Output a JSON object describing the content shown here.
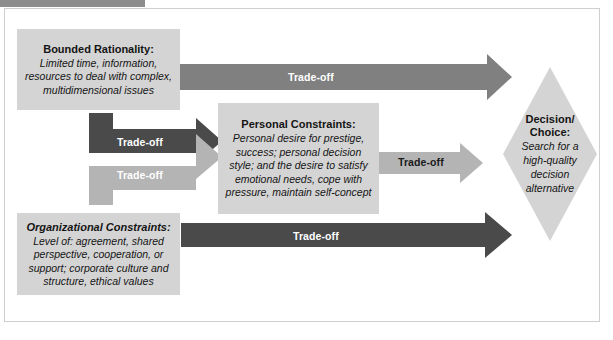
{
  "diagram": {
    "colors": {
      "box_fill": "#d4d4d4",
      "arrow_dark": "#4a4a4a",
      "arrow_medium": "#808080",
      "arrow_light": "#b4b4b4",
      "top_tab": "#8d8d8d",
      "frame_border": "#cfcfcf",
      "text": "#141414"
    },
    "boxes": [
      {
        "id": "bounded-rationality",
        "heading": "Bounded Rationality:",
        "heading_style": "bold",
        "body": "Limited time, information, resources to deal with complex, multidimensional issues"
      },
      {
        "id": "personal-constraints",
        "heading": "Personal Constraints:",
        "heading_style": "bold",
        "body": "Personal desire for prestige, success; personal decision style; and the desire to satisfy emotional needs, cope with pressure, maintain self-concept"
      },
      {
        "id": "organizational-constraints",
        "heading": "Organizational Constraints:",
        "heading_style": "bold-italic",
        "body": "Level of: agreement, shared perspective, cooperation, or support; corporate culture and structure, ethical values"
      }
    ],
    "diamond": {
      "id": "decision-choice",
      "heading_line1": "Decision/",
      "heading_line2": "Choice:",
      "body_line1": "Search for a",
      "body_line2": "high-quality",
      "body_line3": "decision",
      "body_line4": "alternative"
    },
    "arrows": [
      {
        "id": "bounded-to-decision",
        "label": "Trade-off",
        "label_color": "white",
        "fill": "#808080",
        "from": "bounded-rationality",
        "to": "decision-choice",
        "shape": "straight"
      },
      {
        "id": "bounded-to-personal",
        "label": "Trade-off",
        "label_color": "white",
        "fill": "#4a4a4a",
        "from": "bounded-rationality",
        "to": "personal-constraints",
        "shape": "elbow-down-right"
      },
      {
        "id": "organizational-to-personal",
        "label": "Trade-off",
        "label_color": "white",
        "fill": "#b4b4b4",
        "from": "organizational-constraints",
        "to": "personal-constraints",
        "shape": "elbow-up-right"
      },
      {
        "id": "personal-to-decision",
        "label": "Trade-off",
        "label_color": "dark",
        "fill": "#b4b4b4",
        "from": "personal-constraints",
        "to": "decision-choice",
        "shape": "straight"
      },
      {
        "id": "organizational-to-decision",
        "label": "Trade-off",
        "label_color": "white",
        "fill": "#4a4a4a",
        "from": "organizational-constraints",
        "to": "decision-choice",
        "shape": "straight"
      }
    ]
  }
}
